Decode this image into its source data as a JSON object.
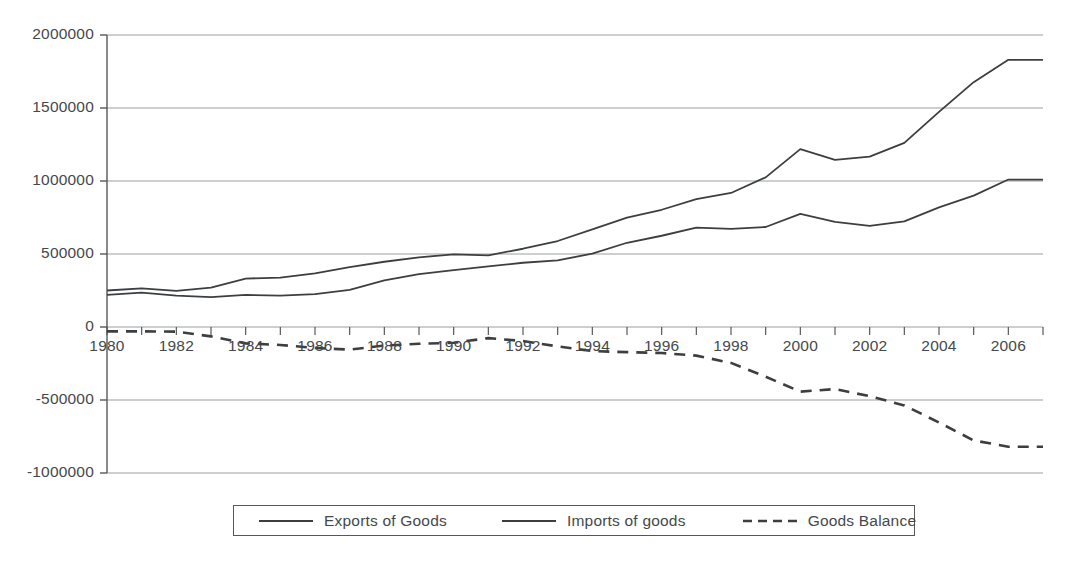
{
  "chart_data": {
    "type": "line",
    "title": "",
    "subtitle": "",
    "xlabel": "",
    "ylabel": "",
    "xlim": [
      1980,
      2007
    ],
    "ylim": [
      -1000000,
      2000000
    ],
    "grid": true,
    "grid_axis": "y",
    "legend_position": "bottom",
    "x": [
      1980,
      1981,
      1982,
      1983,
      1984,
      1985,
      1986,
      1987,
      1988,
      1989,
      1990,
      1991,
      1992,
      1993,
      1994,
      1995,
      1996,
      1997,
      1998,
      1999,
      2000,
      2001,
      2002,
      2003,
      2004,
      2005,
      2006,
      2007
    ],
    "x_tick_labels": [
      "1980",
      "1982",
      "1984",
      "1986",
      "1988",
      "1990",
      "1992",
      "1994",
      "1996",
      "1998",
      "2000",
      "2002",
      "2004",
      "2006"
    ],
    "x_tick_values": [
      1980,
      1982,
      1984,
      1986,
      1988,
      1990,
      1992,
      1994,
      1996,
      1998,
      2000,
      2002,
      2004,
      2006
    ],
    "y_tick_labels": [
      "2000000",
      "1500000",
      "1000000",
      "500000",
      "0",
      "-500000",
      "-1000000"
    ],
    "y_tick_values": [
      2000000,
      1500000,
      1000000,
      500000,
      0,
      -500000,
      -1000000
    ],
    "series": [
      {
        "name": "Exports of Goods",
        "style": "solid",
        "color": "#3c3f41",
        "values": [
          220000,
          235000,
          215000,
          205000,
          220000,
          215000,
          225000,
          255000,
          320000,
          362000,
          390000,
          415000,
          440000,
          456000,
          503000,
          577000,
          625000,
          680000,
          672000,
          685000,
          775000,
          720000,
          693000,
          724000,
          819000,
          900000,
          1010000,
          1010000
        ]
      },
      {
        "name": "Imports of goods",
        "style": "solid",
        "color": "#3c3f41",
        "values": [
          250000,
          265000,
          247000,
          269000,
          332000,
          338000,
          368000,
          410000,
          447000,
          477000,
          498000,
          491000,
          536000,
          589000,
          668000,
          749000,
          803000,
          876000,
          918000,
          1025000,
          1218000,
          1145000,
          1167000,
          1261000,
          1473000,
          1677000,
          1830000,
          1830000
        ]
      },
      {
        "name": "Goods Balance",
        "style": "dashed",
        "color": "#3c3f41",
        "values": [
          -30000,
          -30000,
          -32000,
          -64000,
          -112000,
          -123000,
          -143000,
          -155000,
          -127000,
          -115000,
          -108000,
          -76000,
          -96000,
          -133000,
          -165000,
          -172000,
          -178000,
          -196000,
          -246000,
          -340000,
          -443000,
          -425000,
          -474000,
          -537000,
          -654000,
          -777000,
          -820000,
          -820000
        ]
      }
    ]
  },
  "axes": {
    "y_axis_name": "value-axis",
    "x_axis_name": "year-axis"
  },
  "legend": {
    "entries": [
      {
        "label": "Exports of Goods",
        "style": "solid"
      },
      {
        "label": "Imports of goods",
        "style": "solid"
      },
      {
        "label": "Goods Balance",
        "style": "dashed"
      }
    ]
  },
  "colors": {
    "line": "#3c3f41",
    "gridline": "#9a9d9f",
    "axis": "#55585a",
    "text": "#45484a",
    "background": "#ffffff"
  }
}
